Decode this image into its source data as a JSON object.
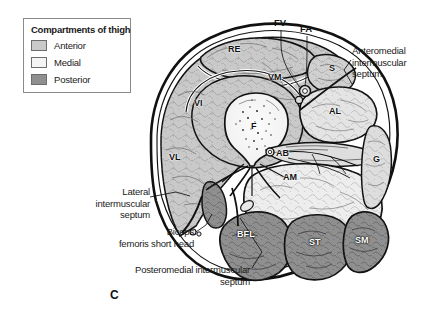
{
  "figure": {
    "letter": "C",
    "colors": {
      "anterior": "#c9c9c9",
      "medial": "#ededed",
      "posterior": "#8f8f8f",
      "outline": "#111111",
      "skin": "#ffffff",
      "bone": "#f7f7f7",
      "text": "#1a1a1a"
    }
  },
  "legend": {
    "title": "Compartments of thigh",
    "items": [
      {
        "label": "Anterior",
        "color": "#c9c9c9"
      },
      {
        "label": "Medial",
        "color": "#f4f4f4"
      },
      {
        "label": "Posterior",
        "color": "#8f8f8f"
      }
    ]
  },
  "annotations": [
    {
      "id": "anteromedial",
      "text": "Anteromedial\nintermuscular\nseptum"
    },
    {
      "id": "lateral",
      "text": "Lateral\nintermuscular\nseptum"
    },
    {
      "id": "biceps",
      "text": "Biceps\nfemoris short head"
    },
    {
      "id": "posteromedial",
      "text": "Posteromedial intermuscular\nseptum"
    }
  ],
  "muscle_labels": [
    {
      "id": "RE",
      "text": "RE"
    },
    {
      "id": "VM",
      "text": "VM"
    },
    {
      "id": "VI",
      "text": "VI"
    },
    {
      "id": "VL",
      "text": "VL"
    },
    {
      "id": "F",
      "text": "F"
    },
    {
      "id": "S",
      "text": "S"
    },
    {
      "id": "AL",
      "text": "AL"
    },
    {
      "id": "AB",
      "text": "AB"
    },
    {
      "id": "AM",
      "text": "AM"
    },
    {
      "id": "G",
      "text": "G"
    },
    {
      "id": "BFL",
      "text": "BFL"
    },
    {
      "id": "ST",
      "text": "ST"
    },
    {
      "id": "SM",
      "text": "SM"
    }
  ],
  "vessel_labels": [
    {
      "id": "FV",
      "text": "FV"
    },
    {
      "id": "FA",
      "text": "FA"
    }
  ]
}
